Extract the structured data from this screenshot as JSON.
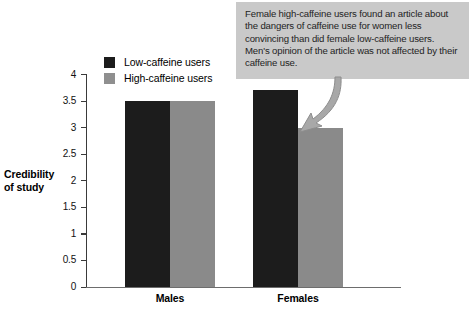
{
  "chart_data": {
    "type": "bar",
    "title": "",
    "xlabel": "",
    "ylabel": "Credibility of study",
    "ylim": [
      0,
      4
    ],
    "ytick_labels": [
      "4",
      "3.5",
      "3",
      "2.5",
      "2",
      "1.5",
      "1",
      "0.5",
      "0"
    ],
    "ytick_values": [
      4,
      3.5,
      3,
      2.5,
      2,
      1.5,
      1,
      0.5,
      0
    ],
    "grid": false,
    "legend_position": "upper-left-inside",
    "categories": [
      "Males",
      "Females"
    ],
    "series": [
      {
        "name": "Low-caffeine users",
        "values": [
          3.5,
          3.7
        ],
        "color": "#1c1c1c"
      },
      {
        "name": "High-caffeine users",
        "values": [
          3.5,
          3.0
        ],
        "color": "#8a8a8a"
      }
    ],
    "annotations": [
      {
        "text": "Female high-caffeine users found an article about the dangers of caffeine use for women less convincing than did female low-caffeine users. Men's opinion of the article was not affected by their caffeine use.",
        "points_to": "Females / High-caffeine users bar"
      }
    ]
  },
  "axis": {
    "y_label_line1": "Credibility",
    "y_label_line2": "of study"
  },
  "legend": {
    "items": [
      {
        "label": "Low-caffeine users",
        "swatch": "legend-swatch-low-caffeine"
      },
      {
        "label": "High-caffeine users",
        "swatch": "legend-swatch-high-caffeine"
      }
    ]
  },
  "callout": {
    "text": "Female high-caffeine users found an article about the dangers of caffeine use for women less convincing than did female low-caffeine users. Men's opinion of the article was not affected by their caffeine use."
  },
  "colors": {
    "low_caffeine": "#1c1c1c",
    "high_caffeine": "#8a8a8a",
    "callout_bg": "#c9c9c9",
    "axis": "#3a3a3a",
    "background": "#ffffff"
  }
}
